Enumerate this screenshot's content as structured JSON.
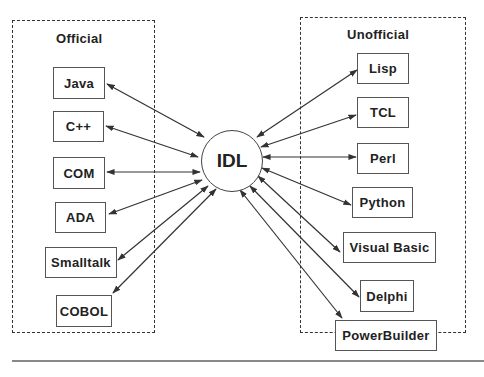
{
  "diagram": {
    "hub": {
      "label": "IDL",
      "cx": 231,
      "cy": 160,
      "r": 30
    },
    "groups": {
      "official": {
        "title": "Official"
      },
      "unofficial": {
        "title": "Unofficial"
      }
    },
    "official_nodes": [
      {
        "label": "Java"
      },
      {
        "label": "C++"
      },
      {
        "label": "COM"
      },
      {
        "label": "ADA"
      },
      {
        "label": "Smalltalk"
      },
      {
        "label": "COBOL"
      }
    ],
    "unofficial_nodes": [
      {
        "label": "Lisp"
      },
      {
        "label": "TCL"
      },
      {
        "label": "Perl"
      },
      {
        "label": "Python"
      },
      {
        "label": "Visual Basic"
      },
      {
        "label": "Delphi"
      },
      {
        "label": "PowerBuilder"
      }
    ],
    "edge_style": "bidirectional-arrow"
  }
}
